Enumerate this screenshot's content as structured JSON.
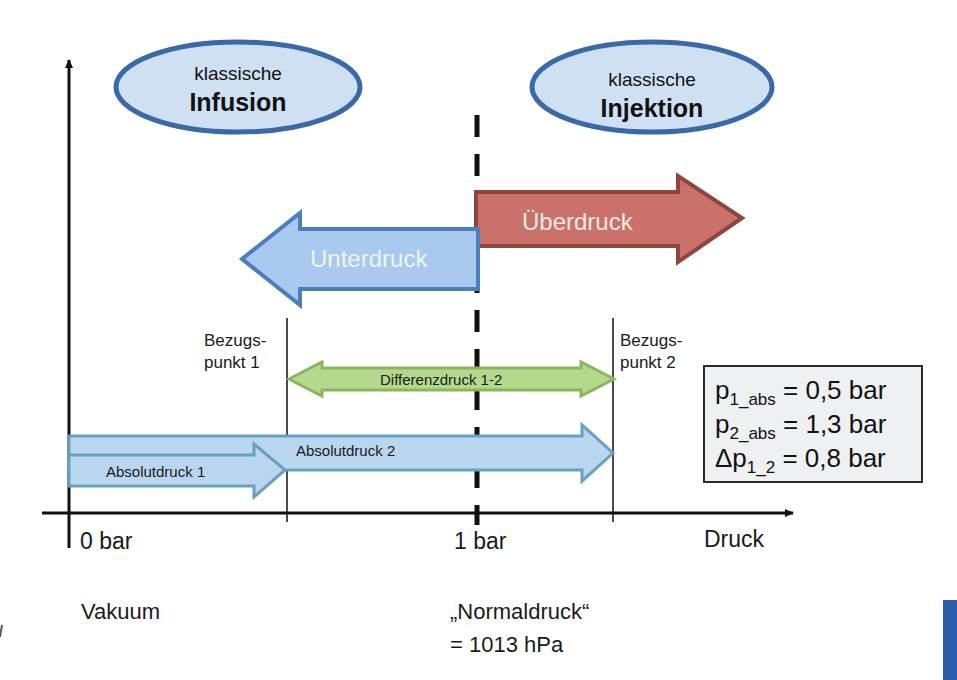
{
  "diagram": {
    "ellipses": {
      "left": {
        "line1": "klassische",
        "line2": "Infusion"
      },
      "right": {
        "line1": "klassische",
        "line2": "Injektion"
      }
    },
    "arrows": {
      "unterdruck": {
        "label": "Unterdruck",
        "direction": "left",
        "color": "#a9c9ef",
        "border": "#4b7ebd"
      },
      "ueberdruck": {
        "label": "Überdruck",
        "direction": "right",
        "color": "#c9716a",
        "border": "#8f4440"
      },
      "differenz": {
        "label": "Differenzdruck 1-2",
        "direction": "both",
        "color": "#b5d98c",
        "border": "#8bb65e"
      },
      "absolut1": {
        "label": "Absolutdruck 1",
        "direction": "right",
        "color": "#b9d6ef",
        "border": "#6a9fc4"
      },
      "absolut2": {
        "label": "Absolutdruck 2",
        "direction": "right",
        "color": "#b9d6ef",
        "border": "#6a9fc4"
      }
    },
    "reference_points": {
      "p1": {
        "line1": "Bezugs-",
        "line2": "punkt 1"
      },
      "p2": {
        "line1": "Bezugs-",
        "line2": "punkt 2"
      }
    },
    "axis": {
      "x_label": "Druck",
      "ticks": [
        "0 bar",
        "1 bar"
      ]
    },
    "annotations": {
      "vacuum": "Vakuum",
      "normal_line1": "„Normaldruck“",
      "normal_line2": "= 1013 hPa"
    },
    "formulas": [
      {
        "symbol": "p",
        "subscript": "1_abs",
        "rest": " = 0,5 bar"
      },
      {
        "symbol": "p",
        "subscript": "2_abs",
        "rest": " = 1,3 bar"
      },
      {
        "symbol": "Δp",
        "subscript": "1_2",
        "rest": " = 0,8 bar"
      }
    ],
    "values": {
      "p1_abs_bar": 0.5,
      "p2_abs_bar": 1.3,
      "delta_p_bar": 0.8,
      "normal_pressure_hPa": 1013
    }
  }
}
